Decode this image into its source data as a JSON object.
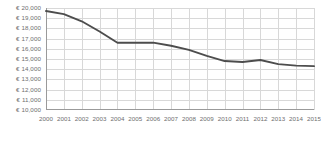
{
  "chart_data": {
    "type": "line",
    "title": "",
    "subtitle": "",
    "xlabel": "",
    "ylabel": "",
    "currency_symbol": "€",
    "grid": true,
    "legend": null,
    "ylim": [
      10000,
      20000
    ],
    "ytick_step": 1000,
    "ytick_labels": [
      "€ 20,000",
      "€ 19,000",
      "€ 18,000",
      "€ 17,000",
      "€ 16,000",
      "€ 15,000",
      "€ 14,000",
      "€ 13,000",
      "€ 12,000",
      "€ 11,000",
      "€ 10,000"
    ],
    "ytick_values": [
      20000,
      19000,
      18000,
      17000,
      16000,
      15000,
      14000,
      13000,
      12000,
      11000,
      10000
    ],
    "categories": [
      "2000",
      "2001",
      "2002",
      "2003",
      "2004",
      "2005",
      "2006",
      "2007",
      "2008",
      "2009",
      "2010",
      "2011",
      "2012",
      "2013",
      "2014",
      "2015"
    ],
    "xlim": [
      2000,
      2015
    ],
    "series": [
      {
        "name": "",
        "color": "#4d4d4d",
        "values": [
          19700,
          19400,
          18700,
          17700,
          16600,
          16600,
          16600,
          16300,
          15900,
          15300,
          14800,
          14700,
          14900,
          14500,
          14350,
          14300
        ]
      }
    ]
  },
  "caption": {
    "cutoff_text": ""
  }
}
